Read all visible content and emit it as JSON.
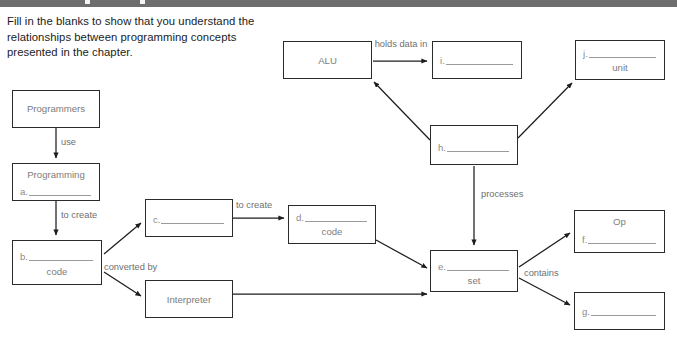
{
  "page": {
    "instructions": "Fill in the blanks to show that you understand the relationships between programming concepts presented in the chapter.",
    "line_color": "#2b2b2b",
    "text_color": "#7c7c7c",
    "top_bar_color": "#6e6e6e"
  },
  "nodes": {
    "programmers": {
      "title": "Programmers",
      "letter": "",
      "subtitle": ""
    },
    "programming": {
      "title": "Programming",
      "letter": "a.",
      "subtitle": ""
    },
    "b": {
      "title": "",
      "letter": "b.",
      "subtitle": "code"
    },
    "c": {
      "title": "",
      "letter": "c.",
      "subtitle": ""
    },
    "d": {
      "title": "",
      "letter": "d.",
      "subtitle": "code"
    },
    "interpreter": {
      "title": "Interpreter",
      "letter": "",
      "subtitle": ""
    },
    "alu": {
      "title": "ALU",
      "letter": "",
      "subtitle": ""
    },
    "i": {
      "title": "",
      "letter": "i.",
      "subtitle": ""
    },
    "j": {
      "title": "",
      "letter": "j.",
      "subtitle": "unit"
    },
    "h": {
      "title": "",
      "letter": "h.",
      "subtitle": ""
    },
    "e": {
      "title": "",
      "letter": "e.",
      "subtitle": "set"
    },
    "f": {
      "title": "Op",
      "letter": "f.",
      "subtitle": ""
    },
    "g": {
      "title": "",
      "letter": "g.",
      "subtitle": ""
    }
  },
  "edge_labels": {
    "use": "use",
    "to_create_1": "to create",
    "converted_by": "converted by",
    "to_create_2": "to create",
    "holds_data_in": "holds data in",
    "processes": "processes",
    "contains": "contains"
  }
}
